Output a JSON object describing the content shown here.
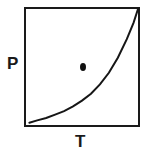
{
  "figure": {
    "kind": "pressure-temperature-phase-diagram",
    "background_color": "#ffffff",
    "line_color": "#161616",
    "marker_color": "#101010",
    "axis_label_color": "#1a1a1a"
  },
  "axes": {
    "y_label": "P",
    "x_label": "T",
    "box_stroke_color": "#1a1a1a",
    "box_stroke_width": 2,
    "ticks": [],
    "tick_labels": []
  },
  "chart_data": {
    "type": "line",
    "title": "",
    "subtitle": "",
    "xlabel": "T",
    "ylabel": "P",
    "xlim": [
      0,
      1
    ],
    "ylim": [
      0,
      1
    ],
    "grid": false,
    "legend": null,
    "legend_position": "none",
    "axis_tick_labels": {
      "x": [],
      "y": []
    },
    "series": [
      {
        "name": "phase-boundary-curve",
        "type": "line",
        "color": "#161616",
        "x": [
          0.03,
          0.1,
          0.18,
          0.26,
          0.34,
          0.42,
          0.5,
          0.58,
          0.66,
          0.74,
          0.82,
          0.9,
          0.96,
          1.0
        ],
        "y": [
          0.02,
          0.04,
          0.06,
          0.09,
          0.12,
          0.16,
          0.21,
          0.27,
          0.35,
          0.45,
          0.58,
          0.74,
          0.88,
          1.0
        ]
      },
      {
        "name": "state-point-marker",
        "type": "scatter",
        "color": "#101010",
        "x": [
          0.51
        ],
        "y": [
          0.5
        ]
      }
    ],
    "annotations": [
      {
        "name": "y-axis-label",
        "text": "P",
        "position": "left-of-axis"
      },
      {
        "name": "x-axis-label",
        "text": "T",
        "position": "below-axis"
      }
    ]
  }
}
